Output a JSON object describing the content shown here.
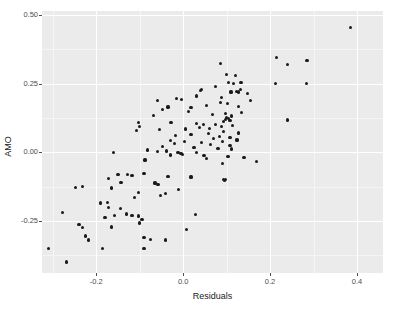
{
  "chart_data": {
    "type": "scatter",
    "title": "",
    "xlabel": "Residuals",
    "ylabel": "AMO",
    "xlim": [
      -0.325,
      0.46
    ],
    "ylim": [
      -0.44,
      0.515
    ],
    "grid": true,
    "legend": null,
    "x_ticks": [
      {
        "value": -0.2,
        "label": "-0.2"
      },
      {
        "value": 0.0,
        "label": "0.0"
      },
      {
        "value": 0.2,
        "label": "0.2"
      },
      {
        "value": 0.4,
        "label": "0.4"
      }
    ],
    "y_ticks": [
      {
        "value": 0.5,
        "label": "0.50"
      },
      {
        "value": 0.25,
        "label": "0.25"
      },
      {
        "value": 0.0,
        "label": "0.00"
      },
      {
        "value": -0.25,
        "label": "-0.25"
      }
    ],
    "x_minor_ticks": [
      -0.3,
      -0.1,
      0.1,
      0.3
    ],
    "y_minor_ticks": [
      0.375,
      0.125,
      -0.125,
      -0.375
    ],
    "point_color": "#1a1a1a",
    "panel_color": "#ebebeb",
    "grid_color": "#ffffff",
    "points": [
      [
        0.385,
        0.455
      ],
      [
        0.215,
        0.345
      ],
      [
        0.285,
        0.335
      ],
      [
        0.24,
        0.32
      ],
      [
        0.085,
        0.325
      ],
      [
        0.1,
        0.285
      ],
      [
        0.12,
        0.28
      ],
      [
        0.115,
        0.25
      ],
      [
        0.133,
        0.255
      ],
      [
        0.105,
        0.255
      ],
      [
        0.213,
        0.25
      ],
      [
        0.283,
        0.25
      ],
      [
        0.075,
        0.24
      ],
      [
        0.04,
        0.225
      ],
      [
        0.043,
        0.23
      ],
      [
        0.132,
        0.228
      ],
      [
        0.122,
        0.222
      ],
      [
        0.128,
        0.22
      ],
      [
        0.11,
        0.22
      ],
      [
        0.148,
        0.215
      ],
      [
        0.03,
        0.205
      ],
      [
        0.088,
        0.2
      ],
      [
        -0.015,
        0.195
      ],
      [
        -0.003,
        0.192
      ],
      [
        -0.06,
        0.19
      ],
      [
        0.155,
        0.188
      ],
      [
        0.086,
        0.182
      ],
      [
        0.102,
        0.178
      ],
      [
        0.053,
        0.17
      ],
      [
        0.127,
        0.168
      ],
      [
        -0.035,
        0.165
      ],
      [
        0.018,
        0.162
      ],
      [
        -0.048,
        0.155
      ],
      [
        0.013,
        0.15
      ],
      [
        0.135,
        0.145
      ],
      [
        0.098,
        0.14
      ],
      [
        0.067,
        0.138
      ],
      [
        -0.068,
        0.135
      ],
      [
        0.112,
        0.132
      ],
      [
        0.1,
        0.128
      ],
      [
        0.104,
        0.124
      ],
      [
        0.097,
        0.12
      ],
      [
        0.24,
        0.118
      ],
      [
        0.108,
        0.115
      ],
      [
        0.093,
        0.112
      ],
      [
        -0.102,
        0.11
      ],
      [
        -0.028,
        0.108
      ],
      [
        0.03,
        0.105
      ],
      [
        0.047,
        0.102
      ],
      [
        0.075,
        0.1
      ],
      [
        0.113,
        0.098
      ],
      [
        -0.1,
        0.095
      ],
      [
        0.088,
        0.093
      ],
      [
        0.038,
        0.09
      ],
      [
        0.06,
        0.088
      ],
      [
        0.005,
        0.085
      ],
      [
        -0.055,
        0.082
      ],
      [
        -0.108,
        0.078
      ],
      [
        0.092,
        0.075
      ],
      [
        0.128,
        0.07
      ],
      [
        0.058,
        0.068
      ],
      [
        0.018,
        0.065
      ],
      [
        -0.018,
        0.062
      ],
      [
        0.083,
        0.058
      ],
      [
        0.108,
        0.055
      ],
      [
        0.07,
        0.05
      ],
      [
        0.124,
        0.045
      ],
      [
        -0.03,
        0.042
      ],
      [
        0.003,
        0.04
      ],
      [
        0.09,
        0.038
      ],
      [
        0.043,
        0.035
      ],
      [
        -0.02,
        0.032
      ],
      [
        0.062,
        0.028
      ],
      [
        0.108,
        0.025
      ],
      [
        -0.048,
        0.022
      ],
      [
        0.025,
        0.018
      ],
      [
        0.08,
        0.015
      ],
      [
        0.112,
        0.012
      ],
      [
        -0.083,
        0.008
      ],
      [
        -0.038,
        0.005
      ],
      [
        -0.06,
        0.002
      ],
      [
        -0.012,
        0.0
      ],
      [
        0.03,
        -0.002
      ],
      [
        -0.005,
        -0.005
      ],
      [
        -0.002,
        -0.008
      ],
      [
        -0.16,
        -0.002
      ],
      [
        -0.03,
        -0.01
      ],
      [
        0.048,
        -0.012
      ],
      [
        0.103,
        -0.015
      ],
      [
        0.14,
        -0.018
      ],
      [
        0.053,
        -0.022
      ],
      [
        -0.088,
        -0.028
      ],
      [
        0.168,
        -0.035
      ],
      [
        0.09,
        -0.04
      ],
      [
        -0.15,
        -0.082
      ],
      [
        -0.118,
        -0.085
      ],
      [
        -0.128,
        -0.082
      ],
      [
        -0.09,
        -0.078
      ],
      [
        -0.035,
        -0.088
      ],
      [
        0.018,
        -0.09
      ],
      [
        0.093,
        -0.098
      ],
      [
        0.095,
        -0.103
      ],
      [
        0.098,
        -0.1
      ],
      [
        -0.172,
        -0.095
      ],
      [
        -0.143,
        -0.11
      ],
      [
        -0.065,
        -0.112
      ],
      [
        -0.058,
        -0.118
      ],
      [
        -0.248,
        -0.128
      ],
      [
        -0.232,
        -0.125
      ],
      [
        -0.165,
        -0.13
      ],
      [
        -0.01,
        -0.135
      ],
      [
        -0.04,
        -0.15
      ],
      [
        -0.103,
        -0.148
      ],
      [
        -0.053,
        -0.158
      ],
      [
        -0.112,
        -0.165
      ],
      [
        -0.19,
        -0.185
      ],
      [
        -0.175,
        -0.182
      ],
      [
        -0.172,
        -0.2
      ],
      [
        -0.145,
        -0.205
      ],
      [
        -0.13,
        -0.225
      ],
      [
        -0.158,
        -0.23
      ],
      [
        -0.118,
        -0.23
      ],
      [
        -0.102,
        -0.232
      ],
      [
        -0.18,
        -0.238
      ],
      [
        -0.095,
        -0.245
      ],
      [
        0.028,
        -0.228
      ],
      [
        -0.278,
        -0.218
      ],
      [
        -0.24,
        -0.262
      ],
      [
        -0.232,
        -0.275
      ],
      [
        -0.165,
        -0.272
      ],
      [
        -0.1,
        -0.258
      ],
      [
        0.008,
        -0.28
      ],
      [
        -0.225,
        -0.305
      ],
      [
        -0.218,
        -0.32
      ],
      [
        -0.09,
        -0.31
      ],
      [
        -0.075,
        -0.318
      ],
      [
        -0.04,
        -0.32
      ],
      [
        -0.185,
        -0.35
      ],
      [
        -0.09,
        -0.35
      ],
      [
        -0.31,
        -0.352
      ],
      [
        -0.268,
        -0.4
      ]
    ]
  }
}
